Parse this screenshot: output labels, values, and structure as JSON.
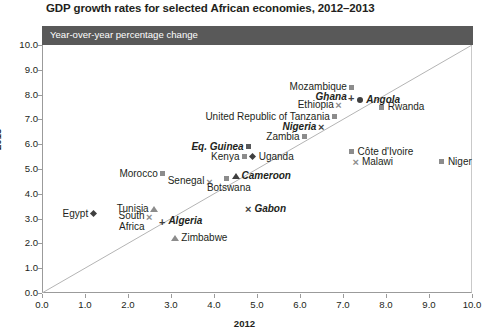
{
  "chart_data": {
    "type": "scatter",
    "title": "GDP growth rates for selected African economies, 2012–2013",
    "subtitle": "Year-over-year percentage change",
    "xlabel": "2012",
    "ylabel": "2013",
    "xlim": [
      0.0,
      10.0
    ],
    "ylim": [
      0.0,
      10.0
    ],
    "xticks": [
      "0.0",
      "1.0",
      "2.0",
      "3.0",
      "4.0",
      "5.0",
      "6.0",
      "7.0",
      "8.0",
      "9.0",
      "10.0"
    ],
    "yticks": [
      "0.0",
      "1.0",
      "2.0",
      "3.0",
      "4.0",
      "5.0",
      "6.0",
      "7.0",
      "8.0",
      "9.0",
      "10.0"
    ],
    "grid": false,
    "legend": "none",
    "reference_line": {
      "label": "y = x parity line",
      "from": [
        0.0,
        0.0
      ],
      "to": [
        10.0,
        10.0
      ]
    },
    "points": [
      {
        "name": "Mozambique",
        "x": 7.2,
        "y": 8.3,
        "marker": "square",
        "label_pos": "left",
        "emphasis": false
      },
      {
        "name": "Ghana",
        "x": 7.2,
        "y": 7.9,
        "marker": "plus",
        "label_pos": "left",
        "emphasis": true
      },
      {
        "name": "Angola",
        "x": 7.4,
        "y": 7.8,
        "marker": "dot",
        "label_pos": "right",
        "emphasis": true
      },
      {
        "name": "Rwanda",
        "x": 7.9,
        "y": 7.5,
        "marker": "square",
        "label_pos": "right",
        "emphasis": false
      },
      {
        "name": "Ethiopia",
        "x": 6.9,
        "y": 7.6,
        "marker": "cross",
        "label_pos": "left",
        "emphasis": false
      },
      {
        "name": "United Republic of Tanzania",
        "x": 6.8,
        "y": 7.1,
        "marker": "square",
        "label_pos": "left",
        "emphasis": false
      },
      {
        "name": "Nigeria",
        "x": 6.5,
        "y": 6.7,
        "marker": "cross",
        "label_pos": "left",
        "emphasis": true
      },
      {
        "name": "Zambia",
        "x": 6.1,
        "y": 6.3,
        "marker": "square",
        "label_pos": "left",
        "emphasis": false
      },
      {
        "name": "Côte d'Ivoire",
        "x": 7.2,
        "y": 5.7,
        "marker": "square",
        "label_pos": "right",
        "emphasis": false
      },
      {
        "name": "Malawi",
        "x": 7.3,
        "y": 5.3,
        "marker": "cross",
        "label_pos": "right",
        "emphasis": false
      },
      {
        "name": "Niger",
        "x": 9.3,
        "y": 5.3,
        "marker": "square",
        "label_pos": "right",
        "emphasis": false
      },
      {
        "name": "Eq. Guinea",
        "x": 4.8,
        "y": 5.9,
        "marker": "square",
        "label_pos": "left",
        "emphasis": true
      },
      {
        "name": "Kenya",
        "x": 4.7,
        "y": 5.5,
        "marker": "square",
        "label_pos": "left",
        "emphasis": false
      },
      {
        "name": "Uganda",
        "x": 4.9,
        "y": 5.5,
        "marker": "diamond",
        "label_pos": "right",
        "emphasis": false
      },
      {
        "name": "Morocco",
        "x": 2.8,
        "y": 4.8,
        "marker": "square",
        "label_pos": "left",
        "emphasis": false
      },
      {
        "name": "Senegal",
        "x": 3.9,
        "y": 4.5,
        "marker": "cross",
        "label_pos": "left",
        "emphasis": false
      },
      {
        "name": "Botswana",
        "x": 4.3,
        "y": 4.6,
        "marker": "square",
        "label_pos": "below",
        "emphasis": false
      },
      {
        "name": "Cameroon",
        "x": 4.5,
        "y": 4.7,
        "marker": "triangle",
        "label_pos": "right",
        "emphasis": true
      },
      {
        "name": "Gabon",
        "x": 4.8,
        "y": 3.4,
        "marker": "cross",
        "label_pos": "right",
        "emphasis": true
      },
      {
        "name": "Egypt",
        "x": 1.2,
        "y": 3.2,
        "marker": "diamond",
        "label_pos": "left",
        "emphasis": false
      },
      {
        "name": "Tunisia",
        "x": 2.6,
        "y": 3.4,
        "marker": "triangle",
        "label_pos": "left",
        "emphasis": false
      },
      {
        "name": "South Africa",
        "x": 2.5,
        "y": 3.1,
        "marker": "cross",
        "label_pos": "left",
        "emphasis": false
      },
      {
        "name": "Algeria",
        "x": 2.8,
        "y": 2.9,
        "marker": "plus",
        "label_pos": "right",
        "emphasis": true
      },
      {
        "name": "Zimbabwe",
        "x": 3.1,
        "y": 2.2,
        "marker": "triangle",
        "label_pos": "right",
        "emphasis": false
      }
    ]
  },
  "colors": {
    "banner_background": "#595959",
    "banner_text": "#ffffff",
    "marker_light": "#8c8c8c",
    "marker_dark": "#3f3f3f",
    "axis": "#9b9b9b",
    "text": "#231f20",
    "background": "#ffffff"
  }
}
